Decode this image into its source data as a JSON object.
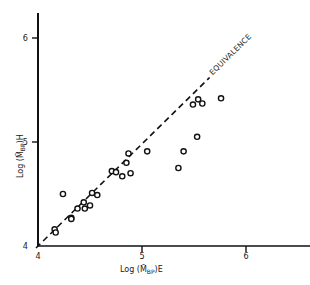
{
  "chart_data": {
    "type": "scatter",
    "title": "",
    "xlabel": "Log (M̄BP)E",
    "ylabel": "Log (M̄BP)H",
    "xlabel_main": "Log (M̄",
    "xlabel_sub": "BP",
    "xlabel_suffix": ")E",
    "ylabel_main": "Log (M̄",
    "ylabel_sub": "BP",
    "ylabel_suffix": ")H",
    "xlim": [
      4,
      6.5
    ],
    "ylim": [
      4,
      6.3
    ],
    "x_ticks": [
      4,
      5,
      6
    ],
    "y_ticks": [
      4,
      5,
      6
    ],
    "x_tick_labels": [
      "4",
      "5",
      "6"
    ],
    "y_tick_labels": [
      "4",
      "5",
      "6"
    ],
    "grid": false,
    "legend": null,
    "annotations": [
      {
        "text": "EQUIVALENCE",
        "note": "dashed y = x reference line"
      }
    ],
    "reference_line": {
      "type": "dashed",
      "from": [
        4.0,
        4.0
      ],
      "to": [
        5.65,
        5.62
      ],
      "label": "EQUIVALENCE"
    },
    "series": [
      {
        "name": "samples",
        "marker": "open-circle",
        "points": [
          [
            4.16,
            4.16
          ],
          [
            4.17,
            4.13
          ],
          [
            4.24,
            4.5
          ],
          [
            4.32,
            4.27
          ],
          [
            4.32,
            4.26
          ],
          [
            4.38,
            4.36
          ],
          [
            4.44,
            4.42
          ],
          [
            4.45,
            4.36
          ],
          [
            4.5,
            4.39
          ],
          [
            4.52,
            4.51
          ],
          [
            4.57,
            4.49
          ],
          [
            4.71,
            4.72
          ],
          [
            4.75,
            4.71
          ],
          [
            4.81,
            4.67
          ],
          [
            4.85,
            4.8
          ],
          [
            4.87,
            4.89
          ],
          [
            4.89,
            4.7
          ],
          [
            5.05,
            4.91
          ],
          [
            5.35,
            4.75
          ],
          [
            5.4,
            4.91
          ],
          [
            5.53,
            5.05
          ],
          [
            5.49,
            5.36
          ],
          [
            5.54,
            5.41
          ],
          [
            5.58,
            5.37
          ],
          [
            5.76,
            5.42
          ]
        ]
      }
    ]
  },
  "layout": {
    "origin_px": [
      38,
      246
    ],
    "px_per_unit": 104,
    "x_axis_end_px": 310,
    "y_axis_top_px": 13
  }
}
